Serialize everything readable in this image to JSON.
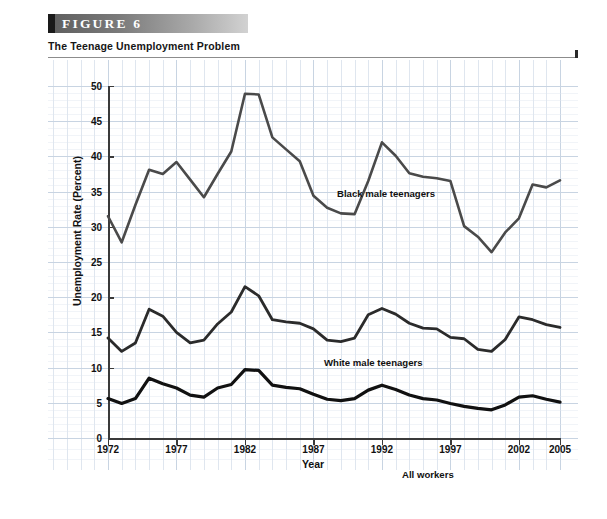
{
  "figure": {
    "banner_label": "FIGURE  6",
    "subtitle": "The Teenage Unemployment Problem",
    "source_line1": "SOURCES: Economic Report of the President (Washington, D.C.: U.S. Government Printing Office, various years); and U.S. Bureau of",
    "source_line2": "Labor Statistics, http://www.bls.gov."
  },
  "chart_data": {
    "type": "line",
    "title": "The Teenage Unemployment Problem",
    "xlabel": "Year",
    "ylabel": "Unemployment Rate (Percent)",
    "xlim": [
      1972,
      2005
    ],
    "ylim": [
      0,
      50
    ],
    "grid": true,
    "legend_position": "inline-annotations",
    "x": [
      1972,
      1973,
      1974,
      1975,
      1976,
      1977,
      1978,
      1979,
      1980,
      1981,
      1982,
      1983,
      1984,
      1985,
      1986,
      1987,
      1988,
      1989,
      1990,
      1991,
      1992,
      1993,
      1994,
      1995,
      1996,
      1997,
      1998,
      1999,
      2000,
      2001,
      2002,
      2003,
      2004,
      2005
    ],
    "xticks": [
      1972,
      1977,
      1982,
      1987,
      1992,
      1997,
      2002,
      2005
    ],
    "yticks": [
      0,
      5,
      10,
      15,
      20,
      25,
      30,
      35,
      40,
      45,
      50
    ],
    "series": [
      {
        "name": "Black male teenagers",
        "color": "#4a4a4a",
        "values": [
          31.5,
          27.8,
          33.1,
          38.1,
          37.5,
          39.2,
          36.7,
          34.2,
          37.5,
          40.7,
          48.9,
          48.8,
          42.7,
          41.0,
          39.3,
          34.4,
          32.7,
          31.9,
          31.8,
          36.5,
          42.0,
          40.1,
          37.6,
          37.1,
          36.9,
          36.5,
          30.1,
          28.6,
          26.4,
          29.2,
          31.2,
          36.0,
          35.6,
          36.6
        ]
      },
      {
        "name": "White male teenagers",
        "color": "#2b2b2b",
        "values": [
          14.2,
          12.3,
          13.5,
          18.3,
          17.3,
          15.0,
          13.5,
          13.9,
          16.2,
          17.9,
          21.5,
          20.2,
          16.8,
          16.5,
          16.3,
          15.5,
          13.9,
          13.7,
          14.2,
          17.5,
          18.4,
          17.6,
          16.3,
          15.6,
          15.5,
          14.3,
          14.1,
          12.6,
          12.3,
          14.0,
          17.2,
          16.8,
          16.1,
          15.7
        ]
      },
      {
        "name": "All workers",
        "color": "#111111",
        "values": [
          5.6,
          4.9,
          5.6,
          8.5,
          7.7,
          7.1,
          6.1,
          5.8,
          7.1,
          7.6,
          9.7,
          9.6,
          7.5,
          7.2,
          7.0,
          6.2,
          5.5,
          5.3,
          5.6,
          6.8,
          7.5,
          6.9,
          6.1,
          5.6,
          5.4,
          4.9,
          4.5,
          4.2,
          4.0,
          4.7,
          5.8,
          6.0,
          5.5,
          5.1
        ]
      }
    ],
    "annotations": [
      {
        "text": "Black male teenagers",
        "series": "Black male teenagers"
      },
      {
        "text": "White male teenagers",
        "series": "White male teenagers"
      },
      {
        "text": "All workers",
        "series": "All workers"
      }
    ]
  }
}
